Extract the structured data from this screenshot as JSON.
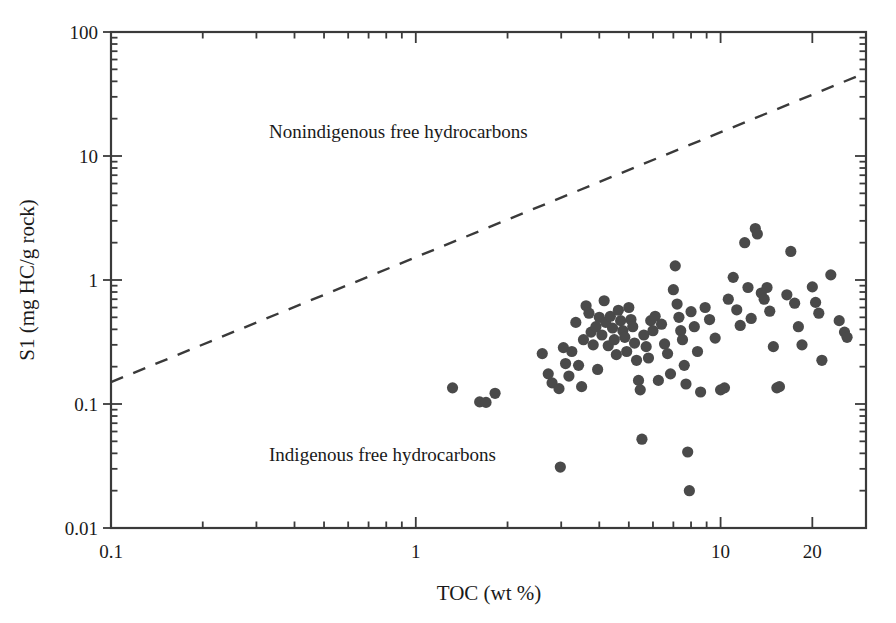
{
  "figure": {
    "background_color": "#ffffff",
    "frame_color": "#3a3a3a",
    "marker_color": "#4a4a4a",
    "line_color": "#3a3a3a"
  },
  "chart_data": {
    "type": "scatter",
    "title": "",
    "xlabel": "TOC (wt %)",
    "ylabel": "S1 (mg HC/g rock)",
    "xscale": "log",
    "yscale": "log",
    "xlim": [
      0.1,
      30
    ],
    "ylim": [
      0.01,
      100
    ],
    "grid": false,
    "legend": null,
    "xticks": [
      0.1,
      1,
      10,
      20
    ],
    "xtick_labels": [
      "0.1",
      "1",
      "10",
      "20"
    ],
    "yticks": [
      0.01,
      0.1,
      1,
      10,
      100
    ],
    "ytick_labels": [
      "0.01",
      "0.1",
      "1",
      "10",
      "100"
    ],
    "annotations": [
      {
        "text": "Nonindigenous free hydrocarbons",
        "x": 0.33,
        "y": 14.0
      },
      {
        "text": "Indigenous free hydrocarbons",
        "x": 0.33,
        "y": 0.035
      }
    ],
    "reference_line": {
      "style": "dashed",
      "label": "",
      "x_start": 0.1,
      "y_start": 0.15,
      "x_end": 30.0,
      "y_end": 47.0
    },
    "series": [
      {
        "name": "samples",
        "marker": "circle",
        "color": "#4a4a4a",
        "points": [
          [
            1.32,
            0.135
          ],
          [
            1.62,
            0.104
          ],
          [
            1.7,
            0.103
          ],
          [
            1.82,
            0.122
          ],
          [
            2.6,
            0.255
          ],
          [
            2.72,
            0.175
          ],
          [
            2.8,
            0.148
          ],
          [
            2.95,
            0.133
          ],
          [
            2.98,
            0.031
          ],
          [
            3.05,
            0.285
          ],
          [
            3.1,
            0.212
          ],
          [
            3.18,
            0.168
          ],
          [
            3.25,
            0.265
          ],
          [
            3.35,
            0.455
          ],
          [
            3.42,
            0.205
          ],
          [
            3.5,
            0.138
          ],
          [
            3.55,
            0.33
          ],
          [
            3.62,
            0.62
          ],
          [
            3.7,
            0.54
          ],
          [
            3.76,
            0.38
          ],
          [
            3.82,
            0.3
          ],
          [
            3.9,
            0.42
          ],
          [
            3.95,
            0.19
          ],
          [
            4.0,
            0.5
          ],
          [
            4.08,
            0.36
          ],
          [
            4.15,
            0.68
          ],
          [
            4.2,
            0.455
          ],
          [
            4.28,
            0.295
          ],
          [
            4.35,
            0.51
          ],
          [
            4.42,
            0.41
          ],
          [
            4.48,
            0.33
          ],
          [
            4.55,
            0.25
          ],
          [
            4.62,
            0.57
          ],
          [
            4.7,
            0.47
          ],
          [
            4.78,
            0.39
          ],
          [
            4.85,
            0.345
          ],
          [
            4.92,
            0.265
          ],
          [
            5.0,
            0.6
          ],
          [
            5.08,
            0.48
          ],
          [
            5.15,
            0.42
          ],
          [
            5.22,
            0.31
          ],
          [
            5.3,
            0.225
          ],
          [
            5.38,
            0.155
          ],
          [
            5.45,
            0.13
          ],
          [
            5.52,
            0.052
          ],
          [
            5.6,
            0.36
          ],
          [
            5.7,
            0.29
          ],
          [
            5.8,
            0.235
          ],
          [
            5.9,
            0.47
          ],
          [
            6.0,
            0.39
          ],
          [
            6.1,
            0.51
          ],
          [
            6.25,
            0.155
          ],
          [
            6.4,
            0.44
          ],
          [
            6.55,
            0.305
          ],
          [
            6.7,
            0.255
          ],
          [
            6.85,
            0.175
          ],
          [
            7.0,
            0.835
          ],
          [
            7.1,
            1.3
          ],
          [
            7.2,
            0.64
          ],
          [
            7.3,
            0.5
          ],
          [
            7.4,
            0.39
          ],
          [
            7.5,
            0.33
          ],
          [
            7.6,
            0.205
          ],
          [
            7.7,
            0.145
          ],
          [
            7.8,
            0.041
          ],
          [
            7.9,
            0.02
          ],
          [
            8.0,
            0.555
          ],
          [
            8.2,
            0.42
          ],
          [
            8.4,
            0.265
          ],
          [
            8.6,
            0.125
          ],
          [
            8.9,
            0.6
          ],
          [
            9.2,
            0.48
          ],
          [
            9.6,
            0.34
          ],
          [
            10.0,
            0.13
          ],
          [
            10.3,
            0.135
          ],
          [
            10.6,
            0.7
          ],
          [
            11.0,
            1.05
          ],
          [
            11.3,
            0.575
          ],
          [
            11.6,
            0.43
          ],
          [
            12.0,
            2.0
          ],
          [
            12.3,
            0.87
          ],
          [
            12.6,
            0.49
          ],
          [
            13.0,
            2.6
          ],
          [
            13.2,
            2.35
          ],
          [
            13.6,
            0.785
          ],
          [
            13.9,
            0.7
          ],
          [
            14.2,
            0.87
          ],
          [
            14.5,
            0.56
          ],
          [
            14.9,
            0.29
          ],
          [
            15.3,
            0.135
          ],
          [
            15.6,
            0.138
          ],
          [
            16.5,
            0.76
          ],
          [
            17.0,
            1.7
          ],
          [
            17.5,
            0.65
          ],
          [
            18.0,
            0.42
          ],
          [
            18.5,
            0.3
          ],
          [
            20.0,
            0.88
          ],
          [
            20.5,
            0.66
          ],
          [
            21.0,
            0.54
          ],
          [
            21.5,
            0.225
          ],
          [
            23.0,
            1.1
          ],
          [
            24.5,
            0.47
          ],
          [
            25.5,
            0.38
          ],
          [
            26.0,
            0.345
          ]
        ]
      }
    ]
  }
}
